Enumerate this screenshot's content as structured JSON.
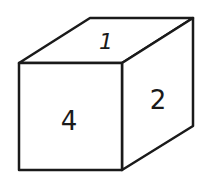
{
  "cube": {
    "faces": {
      "top": "1",
      "front": "4",
      "right": "2"
    },
    "stroke_color": "#1a1a1a",
    "fill_color": "#ffffff"
  }
}
